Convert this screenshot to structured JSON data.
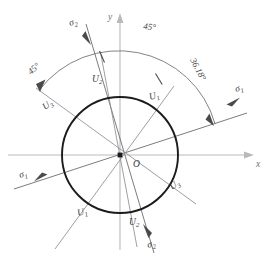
{
  "figure": {
    "type": "geometric-diagram",
    "center_label": "O",
    "axes": {
      "x_label": "x",
      "y_label": "y"
    },
    "circle": {
      "center": [
        120,
        155
      ],
      "radius": 58
    },
    "direction_lines": [
      {
        "id": "sigma1",
        "label_positive": "σ",
        "label_positive_sub": "1",
        "label_negative": "σ",
        "label_negative_sub": "1",
        "angle_deg": 18
      },
      {
        "id": "sigma2",
        "label_positive": "σ",
        "label_positive_sub": "2",
        "label_negative": "σ",
        "label_negative_sub": "2",
        "angle_deg": 108
      },
      {
        "id": "u1",
        "label_positive": "U",
        "label_positive_sub": "1",
        "label_negative": "U",
        "label_negative_sub": "1",
        "angle_deg": 54
      },
      {
        "id": "u2",
        "label_positive": "U",
        "label_positive_sub": "2",
        "label_negative": "U",
        "label_negative_sub": "2",
        "angle_deg": 99
      },
      {
        "id": "u3",
        "label_positive": "U",
        "label_positive_sub": "3",
        "label_negative": "U",
        "label_negative_sub": "3",
        "angle_deg": 144
      }
    ],
    "angle_annotations": [
      {
        "id": "angle-sigma1-to-u1",
        "value": "36.18°"
      },
      {
        "id": "angle-u1-to-u2",
        "value": "45°"
      },
      {
        "id": "angle-u2-to-u3",
        "value": "45°"
      }
    ],
    "colors": {
      "circle": "#1c1c1c",
      "axis": "#b9b9b9",
      "lines": "#8e8e94",
      "text": "#3a3a3a"
    }
  }
}
